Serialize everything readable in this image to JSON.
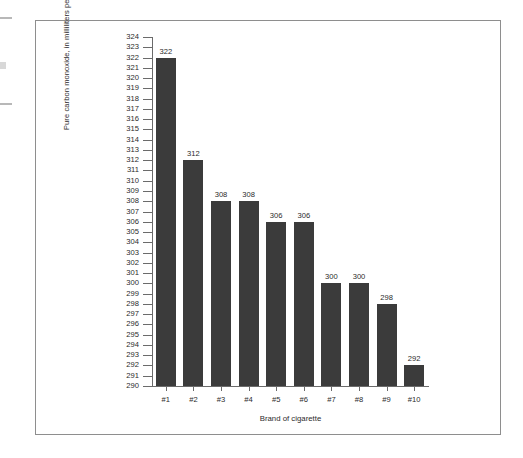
{
  "chart_data": {
    "type": "bar",
    "title": "",
    "xlabel": "Brand of cigarette",
    "ylabel": "Pure carbon monoxide, in milliliters per pack",
    "categories": [
      "#1",
      "#2",
      "#3",
      "#4",
      "#5",
      "#6",
      "#7",
      "#8",
      "#9",
      "#10"
    ],
    "values": [
      322,
      312,
      308,
      308,
      306,
      306,
      300,
      300,
      298,
      292
    ],
    "data_labels": [
      "322",
      "312",
      "308",
      "308",
      "306",
      "306",
      "300",
      "300",
      "298",
      "292"
    ],
    "ylim": [
      290,
      324
    ],
    "ytick_step": 1,
    "ytick_labels": [
      "324",
      "323",
      "322",
      "321",
      "320",
      "319",
      "318",
      "317",
      "316",
      "315",
      "314",
      "313",
      "312",
      "311",
      "310",
      "309",
      "308",
      "307",
      "306",
      "305",
      "304",
      "303",
      "302",
      "301",
      "300",
      "299",
      "298",
      "297",
      "296",
      "295",
      "294",
      "293",
      "292",
      "291",
      "290"
    ],
    "grid": false,
    "legend": null,
    "bar_color": "#3b3b3b",
    "axis_color": "#6b6b6b",
    "text_color": "#2b2b2b",
    "frame_color": "#8e8e8e"
  }
}
